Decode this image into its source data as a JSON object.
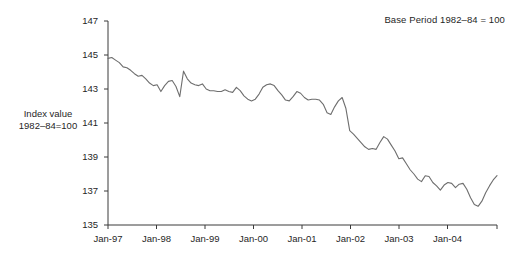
{
  "annotation": "Base Period 1982–84 = 100",
  "y_axis_title_line1": "Index value",
  "y_axis_title_line2": "1982–84=100",
  "chart_data": {
    "type": "line",
    "title": "",
    "subtitle": "",
    "annotation": "Base Period 1982–84 = 100",
    "xlabel": "",
    "ylabel": "Index value 1982–84=100",
    "ylim": [
      135,
      147
    ],
    "yticks": [
      135,
      137,
      139,
      141,
      143,
      145,
      147
    ],
    "ytick_labels": [
      "135",
      "137",
      "139",
      "141",
      "143",
      "145",
      "147"
    ],
    "xticks": [
      "Jan-97",
      "Jan-98",
      "Jan-99",
      "Jan-00",
      "Jan-01",
      "Jan-02",
      "Jan-03",
      "Jan-04"
    ],
    "xtick_labels": [
      "Jan-97",
      "Jan-98",
      "Jan-99",
      "Jan-00",
      "Jan-01",
      "Jan-02",
      "Jan-03",
      "Jan-04"
    ],
    "grid": false,
    "legend": false,
    "line_color": "#6e6e6e",
    "x_start": "Jan-97",
    "x_end": "Aug-05",
    "x_count": 104,
    "series": [
      {
        "name": "Index value",
        "values": [
          144.8,
          144.85,
          144.7,
          144.55,
          144.3,
          144.25,
          144.1,
          143.9,
          143.75,
          143.8,
          143.6,
          143.35,
          143.2,
          143.25,
          142.85,
          143.2,
          143.45,
          143.5,
          143.15,
          142.55,
          144.05,
          143.6,
          143.35,
          143.25,
          143.2,
          143.3,
          143.0,
          142.9,
          142.9,
          142.85,
          142.85,
          142.95,
          142.85,
          142.8,
          143.1,
          142.9,
          142.6,
          142.4,
          142.3,
          142.4,
          142.7,
          143.1,
          143.25,
          143.3,
          143.2,
          142.9,
          142.65,
          142.35,
          142.3,
          142.55,
          142.85,
          142.75,
          142.5,
          142.35,
          142.4,
          142.4,
          142.35,
          142.1,
          141.6,
          141.5,
          141.95,
          142.3,
          142.5,
          141.85,
          140.55,
          140.35,
          140.1,
          139.85,
          139.6,
          139.45,
          139.5,
          139.45,
          139.85,
          140.2,
          140.05,
          139.7,
          139.35,
          138.9,
          138.95,
          138.6,
          138.25,
          138.0,
          137.7,
          137.55,
          137.9,
          137.85,
          137.5,
          137.3,
          137.05,
          137.35,
          137.5,
          137.45,
          137.2,
          137.4,
          137.45,
          137.1,
          136.6,
          136.2,
          136.1,
          136.4,
          136.9,
          137.3,
          137.65,
          137.9
        ]
      }
    ]
  },
  "plot": {
    "left_px": 108,
    "right_px": 497,
    "top_px": 21,
    "bottom_px": 225,
    "x_tick_px": [
      108,
      156.5,
      205,
      253.5,
      302,
      350.5,
      399,
      447.5
    ],
    "y_tick_px": [
      225,
      191,
      157,
      123,
      89,
      55,
      21
    ]
  }
}
